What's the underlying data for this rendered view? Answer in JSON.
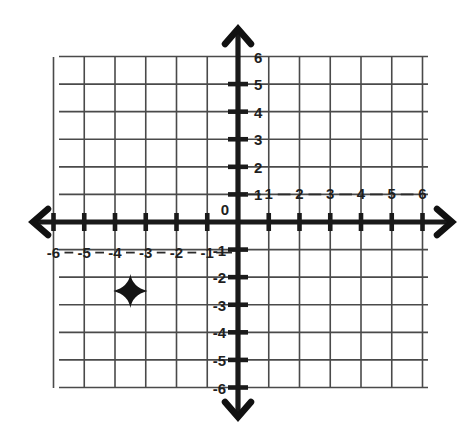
{
  "chart_data": {
    "type": "scatter",
    "title": "",
    "xlabel": "",
    "ylabel": "",
    "xlim": [
      -6,
      6
    ],
    "ylim": [
      -6,
      6
    ],
    "grid": true,
    "legend": null,
    "x_ticks": [
      -6,
      -5,
      -4,
      -3,
      -2,
      -1,
      0,
      1,
      2,
      3,
      4,
      5,
      6
    ],
    "y_ticks": [
      -6,
      -5,
      -4,
      -3,
      -2,
      -1,
      0,
      1,
      2,
      3,
      4,
      5,
      6
    ],
    "x_tick_labels_negative": [
      "-6",
      "-5",
      "-4",
      "-3",
      "-2",
      "-1"
    ],
    "x_tick_labels_positive": [
      "1",
      "2",
      "3",
      "4",
      "5",
      "6"
    ],
    "y_tick_labels_positive": [
      "1",
      "2",
      "3",
      "4",
      "5",
      "6"
    ],
    "y_tick_labels_negative": [
      "-1",
      "-2",
      "-3",
      "-4",
      "-5",
      "-6"
    ],
    "origin_label": "0",
    "points": [
      {
        "x": -3.5,
        "y": -2.5,
        "marker": "four-point-star",
        "label": ""
      }
    ]
  },
  "plane": {
    "origin_label": "0",
    "x_axis_name": "x-axis",
    "y_axis_name": "y-axis",
    "marker_name": "plotted-point-star",
    "axis_color": "#1a1a1a",
    "grid_color": "#4a4a4a",
    "marker_color": "#141414",
    "background_color": "#ffffff",
    "x_labels_negative": [
      {
        "value": -6,
        "text": "-6"
      },
      {
        "value": -5,
        "text": "-5"
      },
      {
        "value": -4,
        "text": "-4"
      },
      {
        "value": -3,
        "text": "-3"
      },
      {
        "value": -2,
        "text": "-2"
      },
      {
        "value": -1,
        "text": "-1"
      }
    ],
    "x_labels_positive": [
      {
        "value": 1,
        "text": "1"
      },
      {
        "value": 2,
        "text": "2"
      },
      {
        "value": 3,
        "text": "3"
      },
      {
        "value": 4,
        "text": "4"
      },
      {
        "value": 5,
        "text": "5"
      },
      {
        "value": 6,
        "text": "6"
      }
    ],
    "y_labels_positive": [
      {
        "value": 1,
        "text": "1"
      },
      {
        "value": 2,
        "text": "2"
      },
      {
        "value": 3,
        "text": "3"
      },
      {
        "value": 4,
        "text": "4"
      },
      {
        "value": 5,
        "text": "5"
      },
      {
        "value": 6,
        "text": "6"
      }
    ],
    "y_labels_negative": [
      {
        "value": -1,
        "text": "-1"
      },
      {
        "value": -2,
        "text": "-2"
      },
      {
        "value": -3,
        "text": "-3"
      },
      {
        "value": -4,
        "text": "-4"
      },
      {
        "value": -5,
        "text": "-5"
      },
      {
        "value": -6,
        "text": "-6"
      }
    ]
  }
}
